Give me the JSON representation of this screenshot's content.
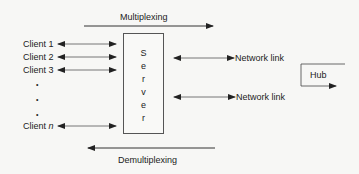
{
  "diagram": {
    "top_label": "Multiplexing",
    "bottom_label": "Demultiplexing",
    "server_letters": [
      "S",
      "e",
      "r",
      "v",
      "e",
      "r"
    ],
    "clients": [
      "Client 1",
      "Client 2",
      "Client 3"
    ],
    "client_n_prefix": "Client ",
    "client_n_var": "n",
    "ellipsis_dots": [
      "•",
      "•",
      "•"
    ],
    "network_links": [
      "Network link",
      "Network link"
    ],
    "hub_label": "Hub",
    "line_color": "#333333"
  }
}
